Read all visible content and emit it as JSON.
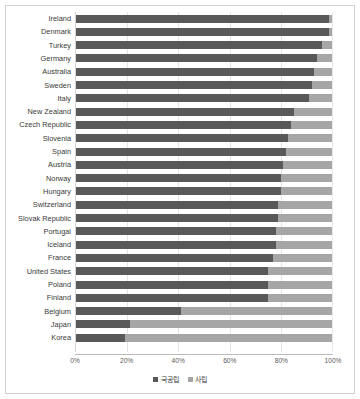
{
  "chart_data": {
    "type": "bar",
    "orientation": "horizontal",
    "stacked": true,
    "percent_stacked": true,
    "title": "",
    "xlabel": "",
    "ylabel": "",
    "xlim": [
      0,
      100
    ],
    "xticks": [
      "0%",
      "20%",
      "40%",
      "60%",
      "80%",
      "100%"
    ],
    "xtick_values": [
      0,
      20,
      40,
      60,
      80,
      100
    ],
    "grid": true,
    "gridlines": "vertical",
    "legend_position": "bottom",
    "legend": [
      "국공립",
      "사립"
    ],
    "colors": {
      "public": "#595959",
      "private": "#a6a6a6",
      "gridline": "#e4e4e4",
      "frame": "#cfcfcf",
      "text": "#3a3a3a"
    },
    "categories": [
      "Ireland",
      "Denmark",
      "Turkey",
      "Germany",
      "Australia",
      "Sweden",
      "Italy",
      "New Zealand",
      "Czech Republic",
      "Slovenia",
      "Spain",
      "Austria",
      "Norway",
      "Hungary",
      "Switzerland",
      "Slovak Republic",
      "Portugal",
      "Iceland",
      "France",
      "United States",
      "Poland",
      "Finland",
      "Belgium",
      "Japan",
      "Korea"
    ],
    "series": [
      {
        "name": "국공립",
        "values": [
          99,
          99,
          96,
          94,
          93,
          92,
          91,
          85,
          84,
          83,
          82,
          81,
          80,
          80,
          79,
          79,
          78,
          78,
          77,
          75,
          75,
          75,
          41,
          21,
          19
        ]
      },
      {
        "name": "사립",
        "values": [
          1,
          1,
          4,
          6,
          7,
          8,
          9,
          15,
          16,
          17,
          18,
          19,
          20,
          20,
          21,
          21,
          22,
          22,
          23,
          25,
          25,
          25,
          59,
          79,
          81
        ]
      }
    ]
  }
}
